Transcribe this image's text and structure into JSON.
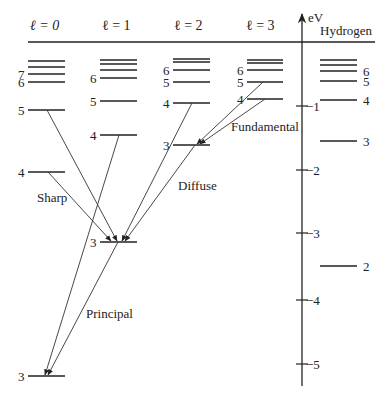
{
  "header": {
    "columns": [
      {
        "label": "ℓ = 0",
        "x": 36
      },
      {
        "label": "ℓ = 1",
        "x": 108
      },
      {
        "label": "ℓ = 2",
        "x": 180
      },
      {
        "label": "ℓ = 3",
        "x": 252
      }
    ],
    "axis_unit": "eV",
    "hydrogen_label": "Hydrogen"
  },
  "axis": {
    "ticks": [
      {
        "label": "−1",
        "y": 106
      },
      {
        "label": "−2",
        "y": 170
      },
      {
        "label": "−3",
        "y": 233
      },
      {
        "label": "−4",
        "y": 300
      },
      {
        "label": "−5",
        "y": 364
      }
    ]
  },
  "series_labels": {
    "sharp": "Sharp",
    "principal": "Principal",
    "diffuse": "Diffuse",
    "fundamental": "Fundamental"
  },
  "levels": {
    "l0": {
      "x1": 28,
      "x2": 65,
      "lines": [
        {
          "y": 61,
          "n": ""
        },
        {
          "y": 67,
          "n": ""
        },
        {
          "y": 74,
          "n": "7"
        },
        {
          "y": 82,
          "n": "6"
        },
        {
          "y": 110,
          "n": "5"
        },
        {
          "y": 172,
          "n": "4"
        },
        {
          "y": 376,
          "n": "3"
        }
      ]
    },
    "l1": {
      "x1": 100,
      "x2": 137,
      "lines": [
        {
          "y": 60,
          "n": ""
        },
        {
          "y": 64,
          "n": ""
        },
        {
          "y": 70,
          "n": ""
        },
        {
          "y": 78,
          "n": "6"
        },
        {
          "y": 101,
          "n": "5"
        },
        {
          "y": 135,
          "n": "4"
        },
        {
          "y": 242,
          "n": "3"
        }
      ]
    },
    "l2": {
      "x1": 173,
      "x2": 210,
      "lines": [
        {
          "y": 59,
          "n": ""
        },
        {
          "y": 62,
          "n": ""
        },
        {
          "y": 70,
          "n": "6"
        },
        {
          "y": 82,
          "n": "5"
        },
        {
          "y": 103,
          "n": "4"
        },
        {
          "y": 145,
          "n": "3"
        }
      ]
    },
    "l3": {
      "x1": 247,
      "x2": 283,
      "lines": [
        {
          "y": 60,
          "n": ""
        },
        {
          "y": 63,
          "n": ""
        },
        {
          "y": 70,
          "n": "6"
        },
        {
          "y": 82,
          "n": "5"
        },
        {
          "y": 99,
          "n": "4"
        }
      ]
    },
    "hydrogen": {
      "x1": 320,
      "x2": 357,
      "lines": [
        {
          "y": 60,
          "n": ""
        },
        {
          "y": 65,
          "n": ""
        },
        {
          "y": 71,
          "n": "6"
        },
        {
          "y": 81,
          "n": "5"
        },
        {
          "y": 100,
          "n": "4"
        },
        {
          "y": 141,
          "n": "3"
        },
        {
          "y": 266,
          "n": "2"
        }
      ]
    }
  }
}
